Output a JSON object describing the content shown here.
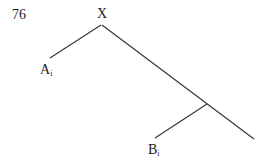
{
  "page": {
    "number": "76"
  },
  "tree": {
    "root": {
      "label": "X"
    },
    "leaves": [
      {
        "letter": "A",
        "subscript": "i"
      },
      {
        "letter": "B",
        "subscript": "i"
      }
    ]
  }
}
